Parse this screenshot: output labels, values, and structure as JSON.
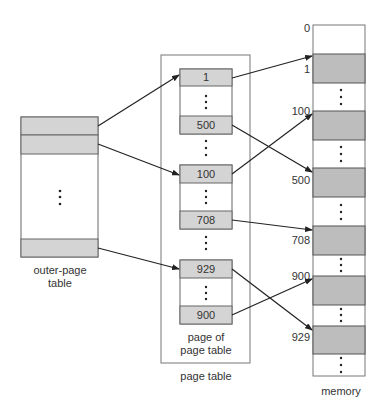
{
  "outer_table": {
    "label_line1": "outer-page",
    "label_line2": "table"
  },
  "page_table": {
    "label": "page table",
    "inner_label_line1": "page of",
    "inner_label_line2": "page table",
    "entries": [
      "1",
      "500",
      "100",
      "708",
      "929",
      "900"
    ]
  },
  "memory": {
    "label": "memory",
    "addresses": [
      "0",
      "1",
      "100",
      "500",
      "708",
      "900",
      "929"
    ]
  },
  "colors": {
    "shaded": "#bdbdbd",
    "shaded_light": "#d4d4d4",
    "stroke": "#555555",
    "arrow": "#222222"
  }
}
